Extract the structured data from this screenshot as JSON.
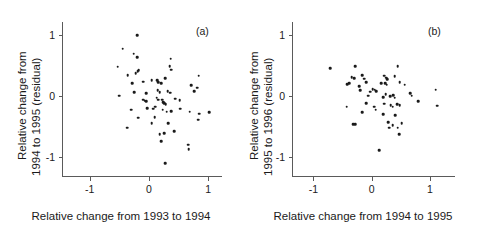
{
  "figure": {
    "background": "#ffffff",
    "point_color": "#1a1a1a",
    "axis_color": "#5a5a5a"
  },
  "panels": [
    {
      "tag": "(a)",
      "xlabel": "Relative change from 1993 to 1994",
      "ylabel_line1": "Relative change from",
      "ylabel_line2": "1994 to 1995 (residual)",
      "xticks": [
        "-1",
        "0",
        "1"
      ],
      "yticks": [
        "1",
        "0",
        "-1"
      ]
    },
    {
      "tag": "(b)",
      "xlabel": "Relative change from 1994 to 1995",
      "ylabel_line1": "Relative change from",
      "ylabel_line2": "1995 to 1996 (residual)",
      "xticks": [
        "-1",
        "0",
        "1"
      ],
      "yticks": [
        "1",
        "0",
        "-1"
      ]
    }
  ],
  "chart_data": [
    {
      "type": "scatter",
      "title": "(a)",
      "xlabel": "Relative change from 1993 to 1994",
      "ylabel": "Relative change from 1994 to 1995 (residual)",
      "xlim": [
        -1.45,
        1.25
      ],
      "ylim": [
        -1.32,
        1.22
      ],
      "xticks": [
        -1,
        0,
        1
      ],
      "yticks": [
        -1,
        0,
        1
      ],
      "grid": false,
      "legend": null,
      "annotations": [
        "(a)"
      ],
      "points": [
        [
          -0.2,
          1.0
        ],
        [
          -0.44,
          0.78
        ],
        [
          -0.26,
          0.7
        ],
        [
          -0.2,
          0.64
        ],
        [
          -0.53,
          0.49
        ],
        [
          0.37,
          0.62
        ],
        [
          -0.36,
          0.35
        ],
        [
          -0.19,
          0.41
        ],
        [
          -0.17,
          0.43
        ],
        [
          -0.22,
          0.38
        ],
        [
          0.35,
          0.5
        ],
        [
          0.38,
          0.44
        ],
        [
          0.84,
          0.34
        ],
        [
          -0.28,
          0.22
        ],
        [
          -0.1,
          0.24
        ],
        [
          0.05,
          0.27
        ],
        [
          0.14,
          0.27
        ],
        [
          0.16,
          0.23
        ],
        [
          0.27,
          0.3
        ],
        [
          0.21,
          0.22
        ],
        [
          0.71,
          0.18
        ],
        [
          -0.5,
          0.01
        ],
        [
          -0.25,
          0.07
        ],
        [
          -0.05,
          0.05
        ],
        [
          0.15,
          0.1
        ],
        [
          0.18,
          0.07
        ],
        [
          0.32,
          0.09
        ],
        [
          0.36,
          0.06
        ],
        [
          0.76,
          0.09
        ],
        [
          0.81,
          0.14
        ],
        [
          -0.1,
          -0.05
        ],
        [
          -0.07,
          -0.07
        ],
        [
          -0.05,
          -0.08
        ],
        [
          0.13,
          -0.02
        ],
        [
          0.16,
          -0.05
        ],
        [
          0.22,
          -0.05
        ],
        [
          0.24,
          -0.09
        ],
        [
          0.26,
          -0.11
        ],
        [
          0.28,
          -0.13
        ],
        [
          0.44,
          -0.04
        ],
        [
          0.52,
          -0.06
        ],
        [
          -0.3,
          -0.22
        ],
        [
          -0.03,
          -0.19
        ],
        [
          0.07,
          -0.2
        ],
        [
          0.11,
          -0.17
        ],
        [
          0.23,
          -0.22
        ],
        [
          0.3,
          -0.25
        ],
        [
          0.38,
          -0.24
        ],
        [
          0.53,
          -0.2
        ],
        [
          0.69,
          -0.25
        ],
        [
          0.85,
          -0.28
        ],
        [
          1.02,
          -0.26
        ],
        [
          -0.18,
          -0.35
        ],
        [
          0.1,
          -0.34
        ],
        [
          0.83,
          -0.38
        ],
        [
          -0.37,
          -0.51
        ],
        [
          0.05,
          -0.44
        ],
        [
          0.33,
          -0.44
        ],
        [
          0.18,
          -0.62
        ],
        [
          0.26,
          -0.6
        ],
        [
          0.43,
          -0.57
        ],
        [
          0.21,
          -0.73
        ],
        [
          0.66,
          -0.79
        ],
        [
          0.67,
          -0.86
        ],
        [
          0.27,
          -1.09
        ]
      ]
    },
    {
      "type": "scatter",
      "title": "(b)",
      "xlabel": "Relative change from 1994 to 1995",
      "ylabel": "Relative change from 1995 to 1996 (residual)",
      "xlim": [
        -1.35,
        1.45
      ],
      "ylim": [
        -1.32,
        1.22
      ],
      "xticks": [
        -1,
        0,
        1
      ],
      "yticks": [
        -1,
        0,
        1
      ],
      "grid": false,
      "legend": null,
      "annotations": [
        "(b)"
      ],
      "points": [
        [
          -0.28,
          0.5
        ],
        [
          -0.71,
          0.46
        ],
        [
          0.45,
          0.5
        ],
        [
          -0.34,
          0.32
        ],
        [
          -0.3,
          0.3
        ],
        [
          -0.16,
          0.35
        ],
        [
          -0.13,
          0.29
        ],
        [
          0.22,
          0.34
        ],
        [
          0.25,
          0.31
        ],
        [
          0.27,
          0.28
        ],
        [
          0.4,
          0.33
        ],
        [
          -0.42,
          0.2
        ],
        [
          -0.38,
          0.22
        ],
        [
          -0.21,
          0.17
        ],
        [
          -0.09,
          0.23
        ],
        [
          0.17,
          0.22
        ],
        [
          0.23,
          0.22
        ],
        [
          0.26,
          0.19
        ],
        [
          0.48,
          0.23
        ],
        [
          0.57,
          0.19
        ],
        [
          -0.2,
          0.1
        ],
        [
          -0.02,
          0.08
        ],
        [
          0.02,
          0.12
        ],
        [
          0.05,
          0.11
        ],
        [
          0.08,
          0.09
        ],
        [
          0.24,
          0.04
        ],
        [
          1.1,
          0.11
        ],
        [
          -0.06,
          0.01
        ],
        [
          0.2,
          -0.01
        ],
        [
          0.32,
          0.0
        ],
        [
          0.37,
          0.02
        ],
        [
          0.4,
          -0.02
        ],
        [
          0.66,
          0.05
        ],
        [
          0.69,
          0.01
        ],
        [
          -0.43,
          -0.17
        ],
        [
          -0.09,
          -0.11
        ],
        [
          0.04,
          -0.17
        ],
        [
          0.22,
          -0.12
        ],
        [
          0.33,
          -0.14
        ],
        [
          0.36,
          -0.17
        ],
        [
          0.44,
          -0.13
        ],
        [
          0.48,
          -0.14
        ],
        [
          0.8,
          -0.08
        ],
        [
          1.13,
          -0.15
        ],
        [
          -0.16,
          -0.26
        ],
        [
          0.07,
          -0.22
        ],
        [
          0.2,
          -0.29
        ],
        [
          0.41,
          -0.31
        ],
        [
          -0.32,
          -0.45
        ],
        [
          -0.28,
          -0.45
        ],
        [
          0.29,
          -0.42
        ],
        [
          0.36,
          -0.47
        ],
        [
          0.52,
          -0.44
        ],
        [
          0.3,
          -0.51
        ],
        [
          0.45,
          -0.51
        ],
        [
          0.47,
          -0.62
        ],
        [
          0.13,
          -0.88
        ]
      ]
    }
  ]
}
